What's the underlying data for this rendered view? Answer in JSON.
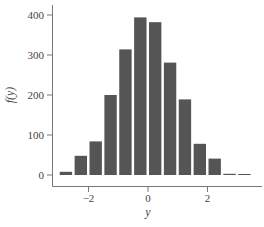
{
  "chart_data": {
    "type": "bar",
    "title": "",
    "xlabel": "y",
    "ylabel": "f(y)",
    "categories": [
      -2.75,
      -2.25,
      -1.75,
      -1.25,
      -0.75,
      -0.25,
      0.25,
      0.75,
      1.25,
      1.75,
      2.25,
      2.75,
      3.25
    ],
    "values": [
      8,
      48,
      84,
      200,
      314,
      394,
      382,
      281,
      189,
      78,
      41,
      3,
      1
    ],
    "bin_width": 0.5,
    "xlim": [
      -3.3,
      3.8
    ],
    "ylim": [
      0,
      420
    ],
    "xticks": [
      -2,
      0,
      2
    ],
    "xtick_labels": [
      "−2",
      "0",
      "2"
    ],
    "yticks": [
      0,
      100,
      200,
      300,
      400
    ],
    "ytick_labels": [
      "0",
      "100",
      "200",
      "300",
      "400"
    ],
    "grid": false,
    "legend": null,
    "bar_color": "#555555"
  }
}
